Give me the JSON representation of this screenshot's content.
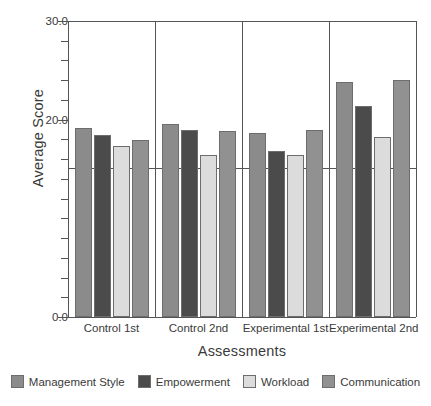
{
  "chart_data": {
    "type": "bar",
    "title": "",
    "xlabel": "Assessments",
    "ylabel": "Average Score",
    "categories": [
      "Control 1st",
      "Control 2nd",
      "Experimental 1st",
      "Experimental 2nd"
    ],
    "series": [
      {
        "name": "Management Style",
        "color": "#8b8b8b",
        "values": [
          19.2,
          19.6,
          18.6,
          23.8
        ]
      },
      {
        "name": "Empowerment",
        "color": "#4b4b4b",
        "values": [
          18.4,
          19.0,
          16.8,
          21.4
        ]
      },
      {
        "name": "Workload",
        "color": "#dcdcdc",
        "values": [
          17.3,
          16.4,
          16.4,
          18.2
        ]
      },
      {
        "name": "Communication",
        "color": "#919191",
        "values": [
          17.9,
          18.9,
          19.0,
          24.0
        ]
      }
    ],
    "ylim": [
      0.0,
      30.0
    ],
    "ytick_labels": [
      "0.0",
      "20.0",
      "30.0"
    ],
    "ytick_values": [
      0.0,
      20.0,
      30.0
    ],
    "yminor_step": 2.0,
    "grid": "horizontal-at-20-and-group-separators",
    "legend_position": "bottom"
  },
  "legend": {
    "items": [
      {
        "label": "Management Style",
        "color": "#8b8b8b"
      },
      {
        "label": "Empowerment",
        "color": "#4b4b4b"
      },
      {
        "label": "Workload",
        "color": "#dcdcdc"
      },
      {
        "label": "Communication",
        "color": "#919191"
      }
    ]
  },
  "axis": {
    "y_title": "Average Score",
    "x_title": "Assessments",
    "y_top_label": "30.0",
    "y_mid_label": "20.0",
    "y_bottom_label": "0.0"
  }
}
